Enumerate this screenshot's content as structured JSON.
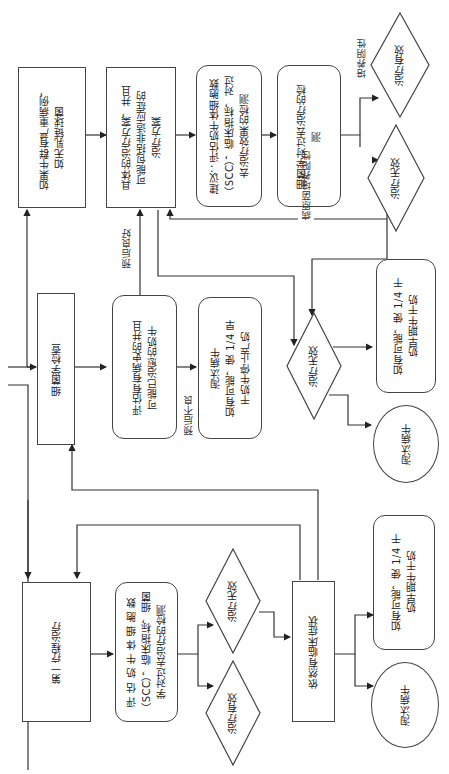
{
  "diagram": {
    "orientation": "rotated 90 degrees counter-clockwise",
    "nodes": {
      "first_treatment": "第一疗程治疗",
      "evaluate_first": "评 估 奶 牛 体 细 胞 数\n（SCC），临床指标，细菌\n学对过去治疗的检测",
      "effective_1": "治疗有效",
      "ineffective_1": "治疗无效",
      "still_symptoms": "依然有临床症状",
      "dry_off_1": "如有可能，使 1/4 干\n奶早期牛干奶",
      "cull_1": "淘汰病牛",
      "bacterio_exam": "细菌学检查",
      "evaluate_history": "评估有有病史的并且\n可能已治愈的奶牛",
      "cull_dry_mid": "淘汰病牛\n如有可能，使 1/4 早\n干奶牛停止产奶",
      "ineffective_mid": "治疗无效",
      "dry_off_2": "如有可能，使 1/4 干\n奶早期牛干奶",
      "cull_2": "淘汰病牛",
      "severe_herd": "如果牛群有严重病例，\n如无乳链球菌",
      "specific_plan": "具体的治疗方案，并且\n可能包括非适应症的\n治疗方案",
      "suggest_eval": "建议：评估奶牛体细胞数\n（SCC），临床指标，对过\n去治疗效果的检测",
      "bacterio_past": "细菌学对过去治疗的检\n测",
      "effective_top": "治疗有效",
      "ineffective_top": "治疗无效"
    },
    "edge_labels": {
      "good_prognosis": "预后良好",
      "poor_prognosis": "预后不良",
      "culture_negative": "培养阴性",
      "pathogen_positive": "病原菌培养阳性"
    }
  }
}
